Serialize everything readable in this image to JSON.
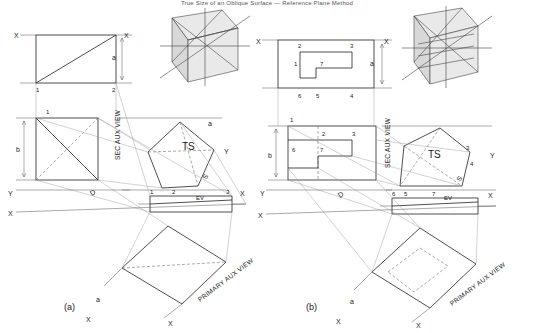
{
  "header": {
    "title": "True Size of an Oblique Surface — Reference Plane Method"
  },
  "captions": {
    "a": "(a)",
    "b": "(b)"
  },
  "view_labels": {
    "sec_aux": "SEC AUX VIEW",
    "primary_aux": "PRIMARY AUX VIEW",
    "ts": "TS",
    "ev": "EV",
    "s": "S",
    "d": "D"
  },
  "axis_labels": {
    "x": "X",
    "y": "Y"
  },
  "panel_a": {
    "top_view_numbers": [
      "1",
      "2"
    ],
    "front_view_numbers": [
      "1",
      "2",
      "3"
    ],
    "aux_numbers": [
      "1",
      "2",
      "3"
    ],
    "dim_labels": [
      "a",
      "b",
      "d"
    ],
    "pictorial_axes": [
      "X",
      "Y"
    ],
    "ev_label": "EV",
    "ts_label": "TS",
    "s_label": "S",
    "d_label": "D",
    "sec_aux_label": "SEC AUX VIEW",
    "primary_aux_label": "PRIMARY AUX VIEW"
  },
  "panel_b": {
    "top_view_numbers": [
      "2",
      "3",
      "1",
      "7",
      "6",
      "5",
      "4"
    ],
    "front_numbers": [
      "1",
      "6",
      "7",
      "2",
      "3",
      "4",
      "5"
    ],
    "aux_numbers": [
      "1",
      "2",
      "3",
      "7",
      "6",
      "5",
      "4"
    ],
    "dim_labels": [
      "a",
      "b",
      "d"
    ],
    "pictorial_axes": [
      "X",
      "Y"
    ],
    "ev_label": "EV",
    "ts_label": "TS",
    "s_label": "S",
    "d_label": "D",
    "sec_aux_label": "SEC AUX VIEW",
    "primary_aux_label": "PRIMARY AUX VIEW"
  }
}
